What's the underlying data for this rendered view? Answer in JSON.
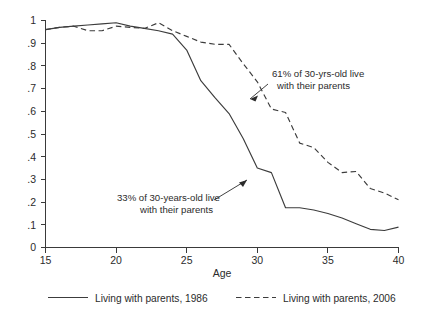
{
  "chart_data": {
    "type": "line",
    "title": "",
    "subtitle": "",
    "xlabel": "Age",
    "ylabel": "",
    "xlim": [
      15,
      40
    ],
    "ylim": [
      0,
      1
    ],
    "grid": false,
    "legend_position": "bottom",
    "x_ticks": [
      "15",
      "20",
      "25",
      "30",
      "35",
      "40"
    ],
    "x_tick_values": [
      15,
      20,
      25,
      30,
      35,
      40
    ],
    "y_ticks": [
      "0",
      ".1",
      ".2",
      ".3",
      ".4",
      ".5",
      ".6",
      ".7",
      ".8",
      ".9",
      "1"
    ],
    "y_tick_values": [
      0,
      0.1,
      0.2,
      0.3,
      0.4,
      0.5,
      0.6,
      0.7,
      0.8,
      0.9,
      1
    ],
    "x": [
      15,
      16,
      17,
      18,
      19,
      20,
      21,
      22,
      23,
      24,
      25,
      26,
      27,
      28,
      29,
      30,
      31,
      32,
      33,
      34,
      35,
      36,
      37,
      38,
      39,
      40
    ],
    "series": [
      {
        "name": "Living with parents, 1986",
        "style": "solid",
        "color": "#3c3c3c",
        "values": [
          0.96,
          0.97,
          0.975,
          0.98,
          0.985,
          0.99,
          0.975,
          0.965,
          0.955,
          0.94,
          0.87,
          0.735,
          0.66,
          0.59,
          0.48,
          0.35,
          0.33,
          0.175,
          0.175,
          0.165,
          0.15,
          0.13,
          0.105,
          0.08,
          0.075,
          0.09
        ]
      },
      {
        "name": "Living with parents, 2006",
        "style": "dashed",
        "color": "#3c3c3c",
        "values": [
          0.96,
          0.97,
          0.975,
          0.955,
          0.955,
          0.975,
          0.97,
          0.965,
          0.99,
          0.955,
          0.93,
          0.905,
          0.895,
          0.895,
          0.81,
          0.73,
          0.61,
          0.595,
          0.46,
          0.44,
          0.375,
          0.33,
          0.335,
          0.26,
          0.24,
          0.21
        ]
      }
    ],
    "annotations": [
      {
        "id": "annotation-2006",
        "text_lines": [
          "61% of 30-yrs-old live",
          "with their parents"
        ],
        "target_x": 31,
        "target_y": 0.61
      },
      {
        "id": "annotation-1986",
        "text_lines": [
          "33% of 30-years-old live",
          "with their parents"
        ],
        "target_x": 31,
        "target_y": 0.33
      }
    ]
  },
  "legend": {
    "items": [
      {
        "label": "Living with parents, 1986",
        "style": "solid"
      },
      {
        "label": "Living with parents, 2006",
        "style": "dashed"
      }
    ]
  }
}
